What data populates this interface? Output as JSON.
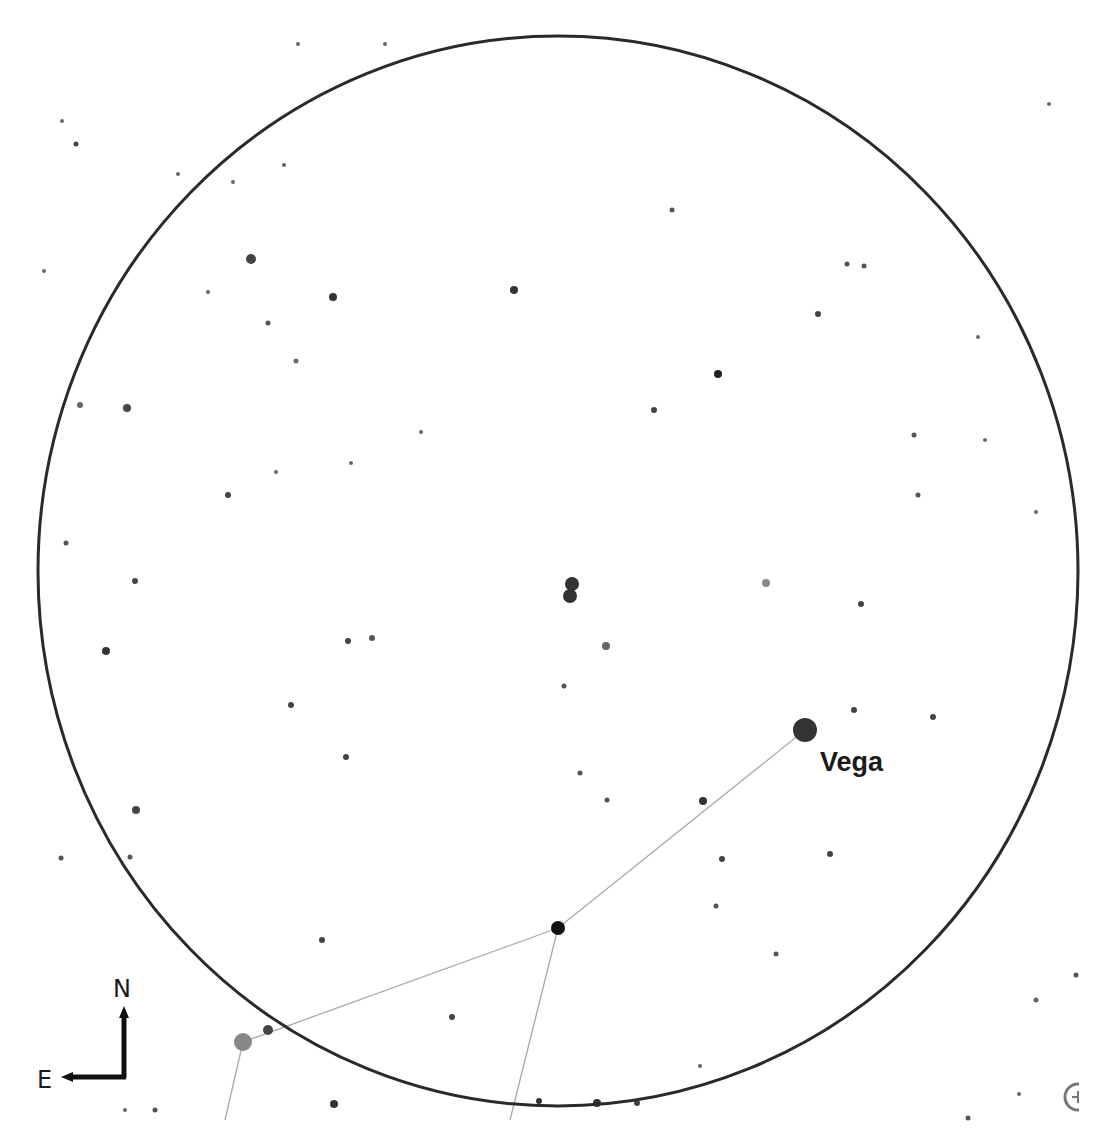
{
  "chart": {
    "background": "#ffffff",
    "field_of_view": {
      "cx": 558,
      "cy": 571,
      "rx": 520,
      "ry": 535,
      "stroke": "#2a2a2a",
      "stroke_width": 3
    },
    "labels": [
      {
        "text": "Vega",
        "x": 820,
        "y": 771
      }
    ],
    "compass": {
      "north": "N",
      "east": "E"
    },
    "corner_icon": "telrad-reticle-icon"
  },
  "chart_data": {
    "type": "scatter",
    "title": "",
    "xlabel": "",
    "ylabel": "",
    "annotations": [
      "Vega",
      "N",
      "E"
    ],
    "constellation_lines": [
      [
        [
          805,
          730
        ],
        [
          558,
          928
        ]
      ],
      [
        [
          558,
          928
        ],
        [
          243,
          1042
        ]
      ],
      [
        [
          558,
          928
        ],
        [
          510,
          1120
        ]
      ],
      [
        [
          243,
          1042
        ],
        [
          225,
          1120
        ]
      ]
    ],
    "stars": [
      {
        "x": 805,
        "y": 730,
        "r": 12,
        "color": "#333333",
        "name": "Vega"
      },
      {
        "x": 558,
        "y": 928,
        "r": 7,
        "color": "#111111"
      },
      {
        "x": 243,
        "y": 1042,
        "r": 9,
        "color": "#888888"
      },
      {
        "x": 268,
        "y": 1030,
        "r": 5,
        "color": "#444444"
      },
      {
        "x": 572,
        "y": 584,
        "r": 7,
        "color": "#333333"
      },
      {
        "x": 570,
        "y": 596,
        "r": 7,
        "color": "#333333"
      },
      {
        "x": 606,
        "y": 646,
        "r": 4,
        "color": "#666666"
      },
      {
        "x": 766,
        "y": 583,
        "r": 4,
        "color": "#888888"
      },
      {
        "x": 251,
        "y": 259,
        "r": 5,
        "color": "#444444"
      },
      {
        "x": 333,
        "y": 297,
        "r": 4,
        "color": "#333333"
      },
      {
        "x": 514,
        "y": 290,
        "r": 4,
        "color": "#333333"
      },
      {
        "x": 718,
        "y": 374,
        "r": 4,
        "color": "#222222"
      },
      {
        "x": 127,
        "y": 408,
        "r": 4,
        "color": "#444444"
      },
      {
        "x": 106,
        "y": 651,
        "r": 4,
        "color": "#333333"
      },
      {
        "x": 136,
        "y": 810,
        "r": 4,
        "color": "#444444"
      },
      {
        "x": 703,
        "y": 801,
        "r": 4,
        "color": "#333333"
      },
      {
        "x": 654,
        "y": 410,
        "r": 3,
        "color": "#444444"
      },
      {
        "x": 818,
        "y": 314,
        "r": 3,
        "color": "#444444"
      },
      {
        "x": 861,
        "y": 604,
        "r": 3,
        "color": "#444444"
      },
      {
        "x": 854,
        "y": 710,
        "r": 3,
        "color": "#444444"
      },
      {
        "x": 933,
        "y": 717,
        "r": 3,
        "color": "#444444"
      },
      {
        "x": 348,
        "y": 641,
        "r": 3,
        "color": "#444444"
      },
      {
        "x": 372,
        "y": 638,
        "r": 3,
        "color": "#555555"
      },
      {
        "x": 291,
        "y": 705,
        "r": 3,
        "color": "#444444"
      },
      {
        "x": 346,
        "y": 757,
        "r": 3,
        "color": "#444444"
      },
      {
        "x": 228,
        "y": 495,
        "r": 3,
        "color": "#444444"
      },
      {
        "x": 135,
        "y": 581,
        "r": 3,
        "color": "#444444"
      },
      {
        "x": 66,
        "y": 543,
        "r": 2.5,
        "color": "#555555"
      },
      {
        "x": 80,
        "y": 405,
        "r": 3,
        "color": "#666666"
      },
      {
        "x": 76,
        "y": 144,
        "r": 2.5,
        "color": "#444444"
      },
      {
        "x": 268,
        "y": 323,
        "r": 2.5,
        "color": "#555555"
      },
      {
        "x": 296,
        "y": 361,
        "r": 2.5,
        "color": "#666666"
      },
      {
        "x": 322,
        "y": 940,
        "r": 3,
        "color": "#444444"
      },
      {
        "x": 452,
        "y": 1017,
        "r": 3,
        "color": "#444444"
      },
      {
        "x": 334,
        "y": 1104,
        "r": 4,
        "color": "#333333"
      },
      {
        "x": 539,
        "y": 1101,
        "r": 3,
        "color": "#333333"
      },
      {
        "x": 597,
        "y": 1103,
        "r": 4,
        "color": "#333333"
      },
      {
        "x": 637,
        "y": 1103,
        "r": 3,
        "color": "#444444"
      },
      {
        "x": 722,
        "y": 859,
        "r": 3,
        "color": "#444444"
      },
      {
        "x": 830,
        "y": 854,
        "r": 3,
        "color": "#444444"
      },
      {
        "x": 716,
        "y": 906,
        "r": 2.5,
        "color": "#555555"
      },
      {
        "x": 776,
        "y": 954,
        "r": 2.5,
        "color": "#555555"
      },
      {
        "x": 918,
        "y": 495,
        "r": 2.5,
        "color": "#555555"
      },
      {
        "x": 914,
        "y": 435,
        "r": 2.5,
        "color": "#555555"
      },
      {
        "x": 847,
        "y": 264,
        "r": 2.5,
        "color": "#555555"
      },
      {
        "x": 864,
        "y": 266,
        "r": 2.5,
        "color": "#555555"
      },
      {
        "x": 672,
        "y": 210,
        "r": 2.5,
        "color": "#555555"
      },
      {
        "x": 580,
        "y": 773,
        "r": 2.5,
        "color": "#555555"
      },
      {
        "x": 607,
        "y": 800,
        "r": 2.5,
        "color": "#555555"
      },
      {
        "x": 564,
        "y": 686,
        "r": 2.5,
        "color": "#555555"
      },
      {
        "x": 1076,
        "y": 975,
        "r": 2.5,
        "color": "#555555"
      },
      {
        "x": 1036,
        "y": 1000,
        "r": 2.5,
        "color": "#666666"
      },
      {
        "x": 968,
        "y": 1118,
        "r": 2.5,
        "color": "#555555"
      },
      {
        "x": 130,
        "y": 857,
        "r": 2.5,
        "color": "#555555"
      },
      {
        "x": 61,
        "y": 858,
        "r": 2.5,
        "color": "#555555"
      },
      {
        "x": 155,
        "y": 1110,
        "r": 2.5,
        "color": "#555555"
      },
      {
        "x": 125,
        "y": 1110,
        "r": 2,
        "color": "#666666"
      },
      {
        "x": 985,
        "y": 440,
        "r": 2,
        "color": "#666666"
      },
      {
        "x": 978,
        "y": 337,
        "r": 2,
        "color": "#666666"
      },
      {
        "x": 1036,
        "y": 512,
        "r": 2,
        "color": "#666666"
      },
      {
        "x": 1049,
        "y": 104,
        "r": 2,
        "color": "#666666"
      },
      {
        "x": 44,
        "y": 271,
        "r": 2,
        "color": "#666666"
      },
      {
        "x": 62,
        "y": 121,
        "r": 2,
        "color": "#666666"
      },
      {
        "x": 178,
        "y": 174,
        "r": 2,
        "color": "#666666"
      },
      {
        "x": 233,
        "y": 182,
        "r": 2,
        "color": "#666666"
      },
      {
        "x": 298,
        "y": 44,
        "r": 2,
        "color": "#666666"
      },
      {
        "x": 385,
        "y": 44,
        "r": 2,
        "color": "#666666"
      },
      {
        "x": 284,
        "y": 165,
        "r": 2,
        "color": "#666666"
      },
      {
        "x": 208,
        "y": 292,
        "r": 2,
        "color": "#666666"
      },
      {
        "x": 276,
        "y": 472,
        "r": 2,
        "color": "#666666"
      },
      {
        "x": 351,
        "y": 463,
        "r": 2,
        "color": "#666666"
      },
      {
        "x": 421,
        "y": 432,
        "r": 2,
        "color": "#666666"
      },
      {
        "x": 700,
        "y": 1066,
        "r": 2,
        "color": "#666666"
      },
      {
        "x": 1019,
        "y": 1094,
        "r": 2,
        "color": "#666666"
      }
    ]
  }
}
